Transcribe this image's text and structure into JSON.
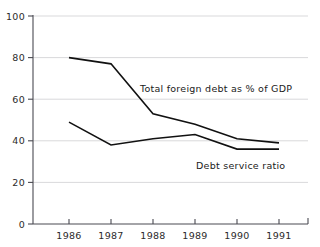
{
  "chart_data": {
    "type": "line",
    "title": "",
    "subtitle": "",
    "xlabel": "",
    "ylabel": "",
    "categories": [
      "1986",
      "1987",
      "1988",
      "1989",
      "1990",
      "1991"
    ],
    "x": [
      1986,
      1987,
      1988,
      1989,
      1990,
      1991
    ],
    "xlim": [
      1985.5,
      1991.6
    ],
    "ylim": [
      0,
      100
    ],
    "yticks": [
      0,
      20,
      40,
      60,
      80,
      100
    ],
    "ytick_labels": [
      "0",
      "20",
      "40",
      "60",
      "80",
      "100"
    ],
    "xtick_labels": [
      "1986",
      "1987",
      "1988",
      "1989",
      "1990",
      "1991"
    ],
    "grid": "horizontal",
    "legend_position": "inline-annotation",
    "series": [
      {
        "name": "Total foreign debt as % of GDP",
        "values": [
          80,
          77,
          53,
          48,
          41,
          39
        ],
        "color": "#111111",
        "annotation": {
          "text": "Total foreign debt as % of GDP",
          "x_px": 140,
          "y_px": 92
        }
      },
      {
        "name": "Debt service ratio",
        "values": [
          49,
          38,
          41,
          43,
          36,
          36
        ],
        "color": "#111111",
        "annotation": {
          "text": "Debt service ratio",
          "x_px": 196,
          "y_px": 169
        }
      }
    ],
    "annotations": [
      "Total foreign debt as % of GDP",
      "Debt service ratio"
    ]
  },
  "axes": {
    "y_axis_name": "percent-axis",
    "x_axis_name": "year-axis"
  },
  "colors": {
    "line": "#111111",
    "grid": "#c8c8cc",
    "axis": "#4a4a52",
    "background": "#ffffff"
  }
}
